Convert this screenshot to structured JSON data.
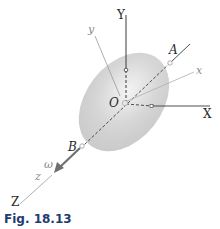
{
  "figure": {
    "caption": "Fig. 18.13",
    "labels": {
      "Y": "Y",
      "y": "y",
      "A": "A",
      "x": "x",
      "O": "O",
      "X": "X",
      "B": "B",
      "omega": "ω",
      "z": "z",
      "Z": "Z"
    },
    "colors": {
      "body_fill": "#d9d9d9",
      "axis_dark": "#3a3a3a",
      "axis_light": "#9a9a9a",
      "arrow": "#6f6f6f",
      "caption": "#1e3c6e"
    }
  }
}
